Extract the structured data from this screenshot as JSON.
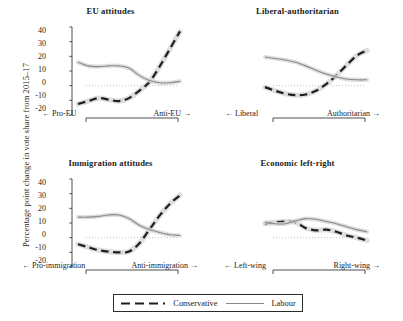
{
  "figure": {
    "ylabel": "Percentage point change in vote share from 2015–17",
    "legend": {
      "conservative_label": "Conservative",
      "labour_label": "Labour",
      "conservative_color": "#1e1e1e",
      "labour_color": "#8a8a8a"
    }
  },
  "chart_data": [
    {
      "type": "line",
      "title": "EU attitudes",
      "xlabel_left": "← Pro-EU",
      "xlabel_right": "Anti-EU →",
      "ylabel": "Percentage point change in vote share from 2015–17",
      "ylim": [
        -20,
        40
      ],
      "yticks": [
        40,
        30,
        20,
        10,
        0,
        -10,
        -20
      ],
      "ytick_labels": [
        "40",
        "30",
        "20",
        "10",
        "0",
        "-10",
        "-20"
      ],
      "grid": false,
      "zero_line": true,
      "legend_position": "bottom-center",
      "x": [
        0,
        0.1,
        0.2,
        0.3,
        0.4,
        0.5,
        0.6,
        0.7,
        0.8,
        0.9,
        1
      ],
      "series": [
        {
          "name": "Conservative",
          "style": "dashed",
          "color": "#1e1e1e",
          "values": [
            -12.5,
            -10.5,
            -8.5,
            -9.5,
            -10.5,
            -8.5,
            -3.5,
            2.5,
            13.0,
            25.0,
            37.0
          ]
        },
        {
          "name": "Labour",
          "style": "solid",
          "color": "#8a8a8a",
          "values": [
            16.0,
            13.5,
            13.0,
            13.5,
            13.5,
            12.0,
            7.0,
            3.5,
            2.0,
            2.0,
            3.0
          ]
        }
      ]
    },
    {
      "type": "line",
      "title": "Liberal-authoritarian",
      "xlabel_left": "← Liberal",
      "xlabel_right": "Authoritarian →",
      "ylim": [
        -20,
        40
      ],
      "yticks": [
        40,
        30,
        20,
        10,
        0,
        -10,
        -20
      ],
      "grid": false,
      "zero_line": true,
      "x": [
        0,
        0.1,
        0.2,
        0.3,
        0.4,
        0.5,
        0.6,
        0.7,
        0.8,
        0.9,
        1
      ],
      "series": [
        {
          "name": "Conservative",
          "style": "dashed",
          "color": "#1e1e1e",
          "values": [
            -1.0,
            -3.5,
            -5.5,
            -6.5,
            -6.0,
            -3.5,
            1.0,
            7.0,
            14.0,
            20.5,
            24.0
          ]
        },
        {
          "name": "Labour",
          "style": "solid",
          "color": "#8a8a8a",
          "values": [
            19.5,
            18.5,
            17.5,
            16.0,
            13.5,
            10.5,
            8.0,
            6.0,
            4.5,
            4.0,
            4.0
          ]
        }
      ]
    },
    {
      "type": "line",
      "title": "Immigration attitudes",
      "xlabel_left": "← Pro-immigration",
      "xlabel_right": "Anti-immigration →",
      "ylim": [
        -20,
        40
      ],
      "yticks": [
        40,
        30,
        20,
        10,
        0,
        -10,
        -20
      ],
      "grid": false,
      "zero_line": true,
      "x": [
        0,
        0.1,
        0.2,
        0.3,
        0.4,
        0.5,
        0.6,
        0.7,
        0.8,
        0.9,
        1
      ],
      "series": [
        {
          "name": "Conservative",
          "style": "dashed",
          "color": "#1e1e1e",
          "values": [
            -4.5,
            -6.5,
            -8.5,
            -9.5,
            -10.0,
            -9.5,
            -4.0,
            5.5,
            15.0,
            23.0,
            29.0
          ]
        },
        {
          "name": "Labour",
          "style": "solid",
          "color": "#8a8a8a",
          "values": [
            14.0,
            14.0,
            14.5,
            15.5,
            15.5,
            13.0,
            8.5,
            5.5,
            3.5,
            2.0,
            1.5
          ]
        }
      ]
    },
    {
      "type": "line",
      "title": "Economic left-right",
      "xlabel_left": "← Left-wing",
      "xlabel_right": "Right-wing →",
      "ylim": [
        -20,
        40
      ],
      "yticks": [
        40,
        30,
        20,
        10,
        0,
        -10,
        -20
      ],
      "grid": false,
      "zero_line": true,
      "x": [
        0,
        0.1,
        0.2,
        0.3,
        0.4,
        0.5,
        0.6,
        0.7,
        0.8,
        0.9,
        1
      ],
      "series": [
        {
          "name": "Conservative",
          "style": "dashed",
          "color": "#1e1e1e",
          "values": [
            9.5,
            10.5,
            11.0,
            10.5,
            6.5,
            5.0,
            5.5,
            4.0,
            1.5,
            0.0,
            -2.0
          ]
        },
        {
          "name": "Labour",
          "style": "solid",
          "color": "#8a8a8a",
          "values": [
            10.5,
            9.5,
            9.5,
            11.5,
            13.0,
            12.5,
            11.0,
            9.5,
            7.5,
            5.5,
            4.0
          ]
        }
      ]
    }
  ]
}
